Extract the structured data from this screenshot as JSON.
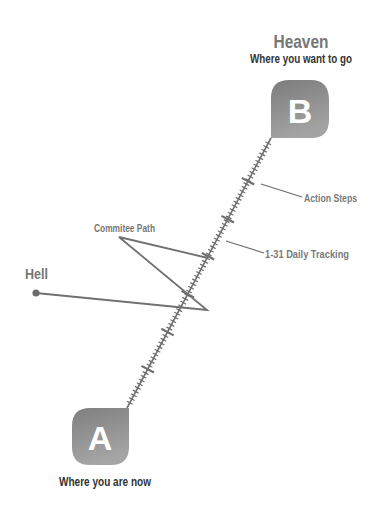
{
  "diagram": {
    "destination": {
      "title": "Heaven",
      "subtitle": "Where you want to go",
      "badge_letter": "B"
    },
    "origin": {
      "badge_letter": "A",
      "subtitle": "Where you are now"
    },
    "deviation": {
      "label": "Hell"
    },
    "annotations": {
      "committee_path": "Commitee Path",
      "action_steps": "Action Steps",
      "daily_tracking": "1-31 Daily Tracking"
    },
    "colors": {
      "badge_gray": "#8a8a8a",
      "line_gray": "#6e6e6e",
      "label_gray": "#7a7a7a",
      "text_dark": "#333333"
    }
  }
}
